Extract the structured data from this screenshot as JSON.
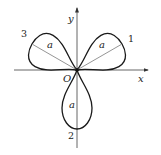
{
  "figure": {
    "type": "three-leaved rose r = a·sin(3θ)",
    "axes": {
      "x_label": "x",
      "y_label": "y",
      "origin_label": "O"
    },
    "petals": [
      {
        "number": "1",
        "radius_label": "a",
        "angle_deg": 30
      },
      {
        "number": "2",
        "radius_label": "a",
        "angle_deg": 270
      },
      {
        "number": "3",
        "radius_label": "a",
        "angle_deg": 150
      }
    ],
    "colors": {
      "curve": "#1a1a1a",
      "axis": "#555555",
      "radius": "#777777"
    }
  }
}
